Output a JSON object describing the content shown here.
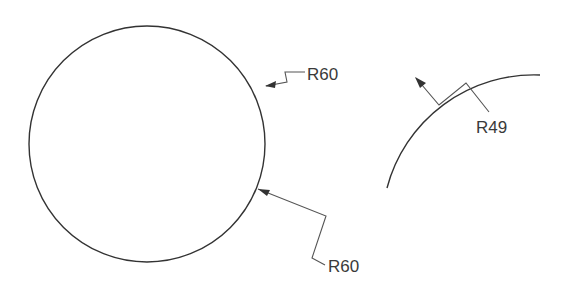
{
  "drawing": {
    "circle": {
      "cx": 147,
      "cy": 144,
      "r": 118
    },
    "arc": {
      "radius_px": 152,
      "start": [
        387,
        188
      ],
      "end": [
        540,
        75
      ]
    },
    "dimensions": [
      {
        "id": "dim1",
        "label": "R60"
      },
      {
        "id": "dim2",
        "label": "R60"
      },
      {
        "id": "dim3",
        "label": "R49"
      }
    ],
    "colors": {
      "line": "#333333",
      "leader": "#555555",
      "text": "#3a3a3a",
      "background": "#ffffff"
    }
  }
}
